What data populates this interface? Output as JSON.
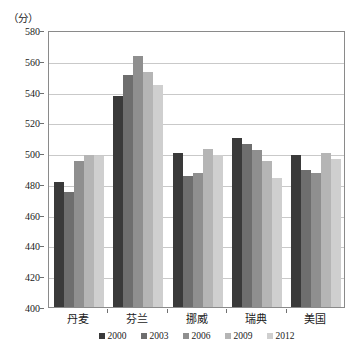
{
  "chart_data": {
    "type": "bar",
    "title": "",
    "subtitle": "",
    "unit_label": "（分）",
    "xlabel": "",
    "ylabel": "",
    "ylim": [
      400,
      580
    ],
    "ytick_step": 20,
    "ytick_labels": [
      "580",
      "560",
      "540",
      "520",
      "500",
      "480",
      "460",
      "440",
      "420",
      "400"
    ],
    "grid": true,
    "legend_position": "bottom",
    "categories": [
      "丹麦",
      "芬兰",
      "挪威",
      "瑞典",
      "美国"
    ],
    "series": [
      {
        "name": "2000",
        "color": "#3a3a3a",
        "values": [
          481,
          537,
          500,
          510,
          499
        ]
      },
      {
        "name": "2003",
        "color": "#6e6e6e",
        "values": [
          475,
          551,
          485,
          506,
          489
        ]
      },
      {
        "name": "2006",
        "color": "#8f8f8f",
        "values": [
          495,
          563,
          487,
          502,
          487
        ]
      },
      {
        "name": "2009",
        "color": "#b5b5b5",
        "values": [
          499,
          553,
          503,
          495,
          500
        ]
      },
      {
        "name": "2012",
        "color": "#cfcfcf",
        "values": [
          498,
          544,
          499,
          484,
          496
        ]
      }
    ]
  },
  "legend": {
    "items": [
      {
        "label": "2000"
      },
      {
        "label": "2003"
      },
      {
        "label": "2006"
      },
      {
        "label": "2009"
      },
      {
        "label": "2012"
      }
    ]
  }
}
